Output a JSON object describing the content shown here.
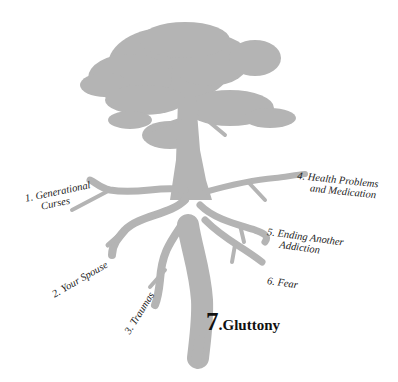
{
  "diagram": {
    "type": "tree-roots",
    "colors": {
      "tree": "#b4b4b4",
      "text": "#222222",
      "background": "#ffffff"
    },
    "roots": [
      {
        "number": "1.",
        "line1": "1. Generational",
        "line2": "Curses"
      },
      {
        "number": "2.",
        "line1": "2. Your Spouse"
      },
      {
        "number": "3.",
        "line1": "3. Traumas"
      },
      {
        "number": "4.",
        "line1": "4. Health Problems",
        "line2": "and Medication"
      },
      {
        "number": "5.",
        "line1": "5. Ending Another",
        "line2": "Addiction"
      },
      {
        "number": "6.",
        "line1": "6. Fear"
      }
    ],
    "highlight": {
      "number": "7",
      "dot": ".",
      "label": "Gluttony"
    }
  }
}
